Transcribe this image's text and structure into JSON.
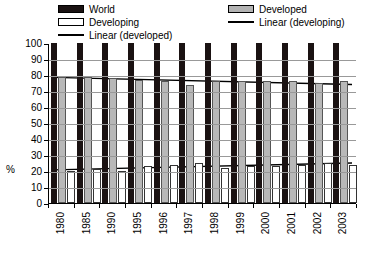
{
  "legend": {
    "left_column": [
      {
        "label": "World",
        "swatch": "black-square-swatch"
      },
      {
        "label": "Developing",
        "swatch": "white-square-swatch"
      },
      {
        "label": "Linear (developed)",
        "swatch": "line-swatch"
      }
    ],
    "right_column": [
      {
        "label": "Developed",
        "swatch": "gray-square-swatch"
      },
      {
        "label": "Linear (developing)",
        "swatch": "line-swatch"
      }
    ]
  },
  "axis": {
    "ylabel": "%",
    "yticks": [
      "100",
      "90",
      "80",
      "70",
      "60",
      "50",
      "40",
      "30",
      "20",
      "10",
      "0"
    ]
  },
  "colors": {
    "world": "#1a1212",
    "developed": "#b8b8b8",
    "developing": "#ffffff",
    "trendline": "#000000",
    "gridline": "#999999"
  },
  "chart_data": {
    "type": "bar",
    "title": "",
    "xlabel": "",
    "ylabel": "%",
    "ylim": [
      0,
      100
    ],
    "ytick_step": 10,
    "grid": true,
    "legend_position": "top",
    "categories": [
      "1980",
      "1985",
      "1990",
      "1995",
      "1996",
      "1997",
      "1998",
      "1999",
      "2000",
      "2001",
      "2002",
      "2003"
    ],
    "series": [
      {
        "name": "World",
        "values": [
          100,
          100,
          100,
          100,
          100,
          100,
          100,
          100,
          100,
          100,
          100,
          100
        ]
      },
      {
        "name": "Developed",
        "values": [
          79,
          79,
          78,
          77,
          76,
          74,
          76,
          76,
          76,
          76,
          75,
          76
        ]
      },
      {
        "name": "Developing",
        "values": [
          20,
          21,
          20,
          23,
          24,
          25,
          22,
          23,
          23,
          24,
          25,
          24
        ]
      }
    ],
    "trendlines": [
      {
        "name": "Linear (developed)",
        "start": 79,
        "end": 74.5
      },
      {
        "name": "Linear (developing)",
        "start": 20.8,
        "end": 25.2
      }
    ]
  }
}
